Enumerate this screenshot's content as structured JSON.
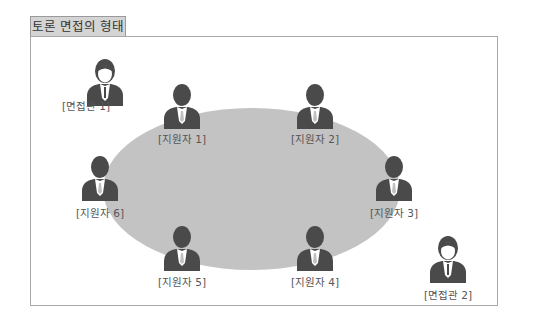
{
  "title": "토론 면접의 형태",
  "colors": {
    "table": "#c3c3c3",
    "person": "#4a4a4a",
    "frame": "#a8a8a8",
    "tab": "#d4d4d4"
  },
  "people": [
    {
      "id": "interviewer-1",
      "role": "interviewer",
      "label": "[면접관 1]",
      "x": 85,
      "y": 58,
      "lx": 86,
      "ly": 98
    },
    {
      "id": "applicant-1",
      "role": "applicant",
      "label": "[지원자 1]",
      "x": 162,
      "y": 83,
      "lx": 182,
      "ly": 131
    },
    {
      "id": "applicant-2",
      "role": "applicant",
      "label": "[지원자 2]",
      "x": 295,
      "y": 83,
      "lx": 315,
      "ly": 131
    },
    {
      "id": "applicant-3",
      "role": "applicant",
      "label": "[지원자 3]",
      "x": 374,
      "y": 155,
      "lx": 394,
      "ly": 205
    },
    {
      "id": "applicant-4",
      "role": "applicant",
      "label": "[지원자 4]",
      "x": 295,
      "y": 225,
      "lx": 315,
      "ly": 274
    },
    {
      "id": "applicant-5",
      "role": "applicant",
      "label": "[지원자 5]",
      "x": 162,
      "y": 225,
      "lx": 182,
      "ly": 274
    },
    {
      "id": "applicant-6",
      "role": "applicant",
      "label": "[지원자 6]",
      "x": 80,
      "y": 155,
      "lx": 100,
      "ly": 205
    },
    {
      "id": "interviewer-2",
      "role": "interviewer",
      "label": "[면접관 2]",
      "x": 428,
      "y": 235,
      "lx": 448,
      "ly": 287
    }
  ]
}
